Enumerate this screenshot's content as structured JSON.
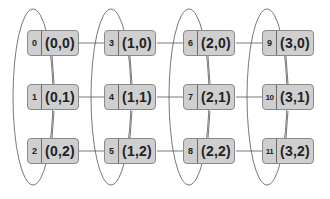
{
  "diagram": {
    "colors": {
      "node_fill": "#cfcfcf",
      "node_border": "#8a8a8a",
      "line": "#555555",
      "text": "#222222"
    },
    "columns": [
      {
        "ellipse": {
          "cx": 33,
          "cy": 97,
          "rx": 20,
          "ry": 88
        }
      },
      {
        "ellipse": {
          "cx": 111,
          "cy": 97,
          "rx": 20,
          "ry": 88
        }
      },
      {
        "ellipse": {
          "cx": 189,
          "cy": 97,
          "rx": 20,
          "ry": 88
        }
      },
      {
        "ellipse": {
          "cx": 267,
          "cy": 97,
          "rx": 20,
          "ry": 88
        }
      }
    ],
    "nodes": [
      {
        "index": "0",
        "coord": "(0,0)",
        "col": 0,
        "row": 0
      },
      {
        "index": "1",
        "coord": "(0,1)",
        "col": 0,
        "row": 1
      },
      {
        "index": "2",
        "coord": "(0,2)",
        "col": 0,
        "row": 2
      },
      {
        "index": "3",
        "coord": "(1,0)",
        "col": 1,
        "row": 0
      },
      {
        "index": "4",
        "coord": "(1,1)",
        "col": 1,
        "row": 1
      },
      {
        "index": "5",
        "coord": "(1,2)",
        "col": 1,
        "row": 2
      },
      {
        "index": "6",
        "coord": "(2,0)",
        "col": 2,
        "row": 0
      },
      {
        "index": "7",
        "coord": "(2,1)",
        "col": 2,
        "row": 1
      },
      {
        "index": "8",
        "coord": "(2,2)",
        "col": 2,
        "row": 2
      },
      {
        "index": "9",
        "coord": "(3,0)",
        "col": 3,
        "row": 0
      },
      {
        "index": "10",
        "coord": "(3,1)",
        "col": 3,
        "row": 1
      },
      {
        "index": "11",
        "coord": "(3,2)",
        "col": 3,
        "row": 2
      }
    ]
  }
}
